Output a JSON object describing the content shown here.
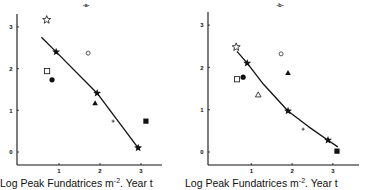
{
  "chart_data": [
    {
      "type": "scatter",
      "panel": "a",
      "title": "-a-",
      "xlabel": "Log Peak Fundatrices m-2, Year t",
      "xlabel_parts": {
        "pre": "Log Peak Fundatrices m",
        "sup": "-2",
        "post": ". Year t"
      },
      "ylabel": "",
      "xticks": [
        1,
        2,
        3
      ],
      "yticks": [
        0,
        1,
        2,
        3
      ],
      "xlim": [
        -0.02,
        3.5
      ],
      "ylim": [
        -0.34,
        3.4
      ],
      "grid": false,
      "legend": null,
      "points": [
        {
          "marker": "open-star",
          "x": 0.7,
          "y": 3.17
        },
        {
          "marker": "filled-star",
          "x": 0.93,
          "y": 2.4
        },
        {
          "marker": "open-circle",
          "x": 1.71,
          "y": 2.37
        },
        {
          "marker": "open-square",
          "x": 0.71,
          "y": 1.94
        },
        {
          "marker": "filled-circle",
          "x": 0.83,
          "y": 1.73
        },
        {
          "marker": "filled-star",
          "x": 1.93,
          "y": 1.41
        },
        {
          "marker": "filled-triangle",
          "x": 1.88,
          "y": 1.17
        },
        {
          "marker": "plus",
          "x": 2.32,
          "y": 0.74
        },
        {
          "marker": "filled-square",
          "x": 3.12,
          "y": 0.74
        },
        {
          "marker": "filled-star",
          "x": 2.93,
          "y": 0.1
        }
      ],
      "fit_line": [
        {
          "x": 0.57,
          "y": 2.75
        },
        {
          "x": 0.93,
          "y": 2.4
        },
        {
          "x": 1.93,
          "y": 1.41
        },
        {
          "x": 2.93,
          "y": 0.1
        }
      ]
    },
    {
      "type": "scatter",
      "panel": "b",
      "title": "-b-",
      "xlabel": "Log Peak Fundatrices m-2, Year t",
      "xlabel_parts": {
        "pre": "Log Peak Fundatrices m",
        "sup": "-2",
        "post": ". Year t"
      },
      "ylabel": "",
      "xticks": [
        1,
        2,
        3
      ],
      "yticks": [
        0,
        1,
        2,
        3
      ],
      "xlim": [
        -0.05,
        3.67
      ],
      "ylim": [
        -0.31,
        3.4
      ],
      "grid": false,
      "legend": null,
      "points": [
        {
          "marker": "open-star",
          "x": 0.63,
          "y": 2.48
        },
        {
          "marker": "filled-star",
          "x": 0.9,
          "y": 2.1
        },
        {
          "marker": "open-circle",
          "x": 1.73,
          "y": 2.32
        },
        {
          "marker": "filled-triangle",
          "x": 1.9,
          "y": 1.87
        },
        {
          "marker": "filled-circle",
          "x": 0.8,
          "y": 1.77
        },
        {
          "marker": "open-square",
          "x": 0.65,
          "y": 1.72
        },
        {
          "marker": "open-triangle",
          "x": 1.17,
          "y": 1.35
        },
        {
          "marker": "filled-star",
          "x": 1.9,
          "y": 0.97
        },
        {
          "marker": "plus",
          "x": 2.27,
          "y": 0.54
        },
        {
          "marker": "filled-star",
          "x": 2.88,
          "y": 0.28
        },
        {
          "marker": "filled-square",
          "x": 3.1,
          "y": 0.02
        }
      ],
      "fit_line": [
        {
          "x": 0.65,
          "y": 2.38
        },
        {
          "x": 0.9,
          "y": 2.1
        },
        {
          "x": 1.3,
          "y": 1.6
        },
        {
          "x": 1.9,
          "y": 0.97
        },
        {
          "x": 2.4,
          "y": 0.6
        },
        {
          "x": 2.88,
          "y": 0.28
        },
        {
          "x": 3.12,
          "y": 0.12
        }
      ]
    }
  ],
  "layout": {
    "panels": [
      {
        "axis_left": 17,
        "axis_bottom": 165,
        "axis_top": 14,
        "axis_right": 162,
        "x0_px": 18,
        "x_px_per_unit": 41,
        "y0_px": 152,
        "y_px_per_unit": 41.7,
        "title_x": 86,
        "title_y": 7,
        "xlabel_x": 0,
        "xlabel_y": 187
      },
      {
        "axis_left": 208,
        "axis_bottom": 165,
        "axis_top": 12,
        "axis_right": 359,
        "x0_px": 210.5,
        "x_px_per_unit": 40.8,
        "y0_px": 152,
        "y_px_per_unit": 42.3,
        "title_x": 280,
        "title_y": 7,
        "xlabel_x": 185,
        "xlabel_y": 187
      }
    ],
    "colors": {
      "ink": "#111111",
      "background": "#ffffff"
    }
  }
}
